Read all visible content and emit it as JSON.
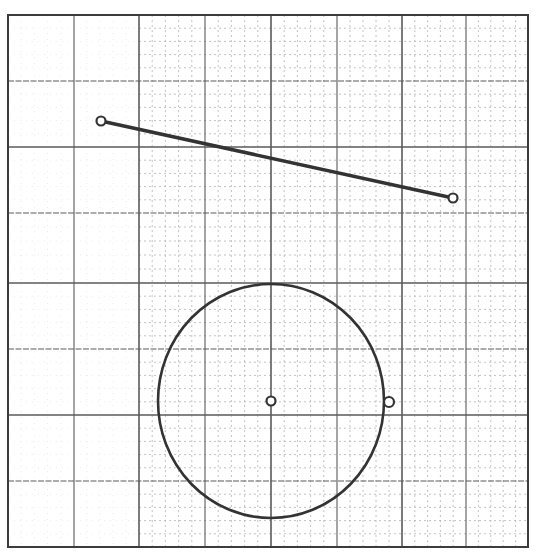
{
  "colors": {
    "background": "#ffffff",
    "major_grid": "#5a5a5a",
    "minor_grid": "#b4b4b4",
    "border": "#3c3c3c",
    "stroke": "#333333"
  },
  "grid": {
    "left": 8,
    "top": 15,
    "right": 528,
    "bottom": 547,
    "major_x": [
      8,
      74,
      139,
      205,
      271,
      337,
      402,
      466,
      528
    ],
    "major_y": [
      15,
      81,
      147,
      213,
      283,
      349,
      415,
      481,
      547
    ],
    "minor_divisions": 5,
    "minor_dense_start_x": 139
  },
  "segment": {
    "start": {
      "x": 101,
      "y": 121
    },
    "end": {
      "x": 453,
      "y": 198
    },
    "endpoint_radius": 4.5
  },
  "circle": {
    "center": {
      "x": 271,
      "y": 401
    },
    "rx": 113,
    "ry": 117,
    "center_marker_radius": 4.5,
    "edge_point": {
      "x": 389,
      "y": 402
    },
    "edge_marker_radius": 5
  }
}
